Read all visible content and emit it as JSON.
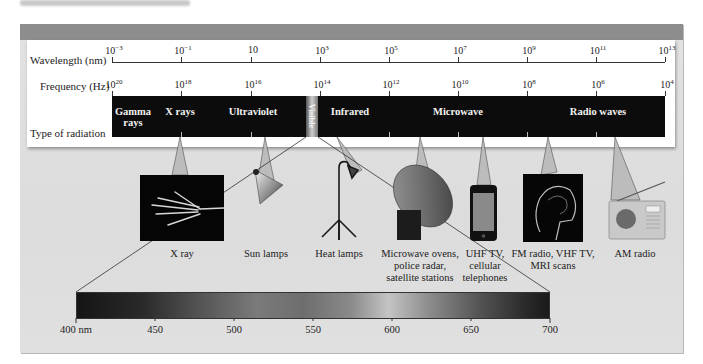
{
  "figure": {
    "colors": {
      "panel_bg": "#e0e0e0",
      "panel_header": "#8d8d8d",
      "card_bg": "#ffffff",
      "band_bg": "#0c0c0c",
      "band_text": "#f2f2f2"
    }
  },
  "wavelength_axis": {
    "label": "Wavelength (nm)",
    "ticks": [
      {
        "base": "10",
        "exp": "−3"
      },
      {
        "base": "10",
        "exp": "−1"
      },
      {
        "base": "10",
        "exp": ""
      },
      {
        "base": "10",
        "exp": "3"
      },
      {
        "base": "10",
        "exp": "5"
      },
      {
        "base": "10",
        "exp": "7"
      },
      {
        "base": "10",
        "exp": "9"
      },
      {
        "base": "10",
        "exp": "11"
      },
      {
        "base": "10",
        "exp": "13"
      }
    ]
  },
  "frequency_axis": {
    "label": "Frequency (Hz)",
    "ticks": [
      {
        "base": "10",
        "exp": "20"
      },
      {
        "base": "10",
        "exp": "18"
      },
      {
        "base": "10",
        "exp": "16"
      },
      {
        "base": "10",
        "exp": "14"
      },
      {
        "base": "10",
        "exp": "12"
      },
      {
        "base": "10",
        "exp": "10"
      },
      {
        "base": "10",
        "exp": "8"
      },
      {
        "base": "10",
        "exp": "6"
      },
      {
        "base": "10",
        "exp": "4"
      }
    ]
  },
  "radiation_band": {
    "label": "Type of radiation",
    "types": [
      {
        "name": "Gamma\nrays"
      },
      {
        "name": "X rays"
      },
      {
        "name": "Ultraviolet"
      },
      {
        "name": "Visible"
      },
      {
        "name": "Infrared"
      },
      {
        "name": "Microwave"
      },
      {
        "name": "Radio waves"
      }
    ]
  },
  "applications": [
    {
      "icon": "xray-hand-icon",
      "label": "X ray"
    },
    {
      "icon": "sun-lamp-icon",
      "label": "Sun lamps"
    },
    {
      "icon": "heat-lamp-icon",
      "label": "Heat lamps"
    },
    {
      "icon": "satellite-dish-icon",
      "label": "Microwave ovens,\npolice radar,\nsatellite stations"
    },
    {
      "icon": "cell-phone-icon",
      "label": "UHF TV,\ncellular\ntelephones"
    },
    {
      "icon": "mri-head-icon",
      "label": "FM radio, VHF TV,\nMRI scans"
    },
    {
      "icon": "am-radio-icon",
      "label": "AM radio"
    }
  ],
  "visible_spectrum": {
    "ticks": [
      "400 nm",
      "450",
      "500",
      "550",
      "600",
      "650",
      "700"
    ]
  }
}
